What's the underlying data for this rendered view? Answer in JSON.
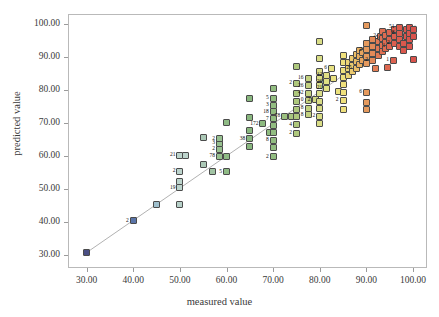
{
  "chart_data": {
    "type": "scatter",
    "title": "",
    "xlabel": "measured value",
    "ylabel": "predicted value",
    "xlim": [
      26,
      103
    ],
    "ylim": [
      26,
      103
    ],
    "grid": false,
    "legend": null,
    "xticks": [
      "30.00",
      "40.00",
      "50.00",
      "60.00",
      "70.00",
      "80.00",
      "90.00",
      "100.00"
    ],
    "xtick_values": [
      30,
      40,
      50,
      60,
      70,
      80,
      90,
      100
    ],
    "yticks": [
      "30.00",
      "40.00",
      "50.00",
      "60.00",
      "70.00",
      "80.00",
      "90.00",
      "100.00"
    ],
    "ytick_values": [
      30,
      40,
      50,
      60,
      70,
      80,
      90,
      100
    ],
    "reference_line": {
      "from": [
        29.5,
        30.2
      ],
      "to": [
        100.5,
        99.5
      ],
      "color": "#a8a8a8"
    },
    "marker": {
      "shape": "square",
      "size_px": 7,
      "edge_color": "#4b4b4b"
    },
    "color_scale": {
      "type": "gradient-by-x",
      "stops": [
        {
          "x": 30,
          "color": "#4a4f84"
        },
        {
          "x": 40,
          "color": "#5a74a8"
        },
        {
          "x": 45,
          "color": "#9fc0cd"
        },
        {
          "x": 50,
          "color": "#b9d3cb"
        },
        {
          "x": 55,
          "color": "#a8c6b4"
        },
        {
          "x": 60,
          "color": "#8fba84"
        },
        {
          "x": 65,
          "color": "#89b77f"
        },
        {
          "x": 70,
          "color": "#93bd80"
        },
        {
          "x": 75,
          "color": "#b3c97c"
        },
        {
          "x": 80,
          "color": "#d8dd86"
        },
        {
          "x": 85,
          "color": "#efe07c"
        },
        {
          "x": 88,
          "color": "#ecc268"
        },
        {
          "x": 90,
          "color": "#e59a5e"
        },
        {
          "x": 93,
          "color": "#e27a54"
        },
        {
          "x": 96,
          "color": "#dd6450"
        },
        {
          "x": 100,
          "color": "#d9534c"
        }
      ]
    },
    "points": [
      {
        "x": 30.0,
        "y": 30.6,
        "c": "#4a4f84",
        "n": ""
      },
      {
        "x": 40.0,
        "y": 40.3,
        "c": "#5a74a8",
        "n": "2"
      },
      {
        "x": 45.0,
        "y": 45.2,
        "c": "#9fc0cd",
        "n": ""
      },
      {
        "x": 50.0,
        "y": 45.2,
        "c": "#b6d0c8",
        "n": ""
      },
      {
        "x": 50.0,
        "y": 50.3,
        "c": "#bcd4cc",
        "n": "19"
      },
      {
        "x": 50.0,
        "y": 52.3,
        "c": "#bcd4cc",
        "n": ""
      },
      {
        "x": 50.0,
        "y": 55.3,
        "c": "#bcd4cc",
        "n": "2"
      },
      {
        "x": 50.0,
        "y": 60.2,
        "c": "#bcd4cc",
        "n": "21"
      },
      {
        "x": 51.3,
        "y": 60.2,
        "c": "#bcd4cc",
        "n": ""
      },
      {
        "x": 55.0,
        "y": 57.4,
        "c": "#abc8b6",
        "n": ""
      },
      {
        "x": 55.0,
        "y": 65.5,
        "c": "#abc8b6",
        "n": ""
      },
      {
        "x": 57.0,
        "y": 55.2,
        "c": "#a2c4a4",
        "n": ""
      },
      {
        "x": 58.5,
        "y": 59.9,
        "c": "#97c08f",
        "n": "78"
      },
      {
        "x": 58.5,
        "y": 62.0,
        "c": "#97c08f",
        "n": "2"
      },
      {
        "x": 58.5,
        "y": 63.8,
        "c": "#97c08f",
        "n": "3"
      },
      {
        "x": 58.5,
        "y": 65.2,
        "c": "#97c08f",
        "n": "2"
      },
      {
        "x": 60.0,
        "y": 55.2,
        "c": "#8fbb85",
        "n": "5"
      },
      {
        "x": 60.0,
        "y": 59.8,
        "c": "#8fbb85",
        "n": ""
      },
      {
        "x": 60.0,
        "y": 70.0,
        "c": "#8fbb85",
        "n": ""
      },
      {
        "x": 65.0,
        "y": 62.8,
        "c": "#89b77f",
        "n": ""
      },
      {
        "x": 65.0,
        "y": 65.2,
        "c": "#89b77f",
        "n": "38"
      },
      {
        "x": 65.0,
        "y": 67.8,
        "c": "#89b77f",
        "n": ""
      },
      {
        "x": 65.0,
        "y": 71.5,
        "c": "#89b77f",
        "n": ""
      },
      {
        "x": 65.0,
        "y": 77.4,
        "c": "#89b77f",
        "n": ""
      },
      {
        "x": 67.8,
        "y": 69.8,
        "c": "#8dba80",
        "n": "172"
      },
      {
        "x": 69.3,
        "y": 67.0,
        "c": "#90bc80",
        "n": ""
      },
      {
        "x": 70.0,
        "y": 59.8,
        "c": "#92bd81",
        "n": "2"
      },
      {
        "x": 70.0,
        "y": 62.5,
        "c": "#92bd81",
        "n": ""
      },
      {
        "x": 70.0,
        "y": 64.7,
        "c": "#92bd81",
        "n": "8"
      },
      {
        "x": 70.0,
        "y": 67.2,
        "c": "#92bd81",
        "n": ""
      },
      {
        "x": 70.0,
        "y": 69.3,
        "c": "#92bd81",
        "n": ""
      },
      {
        "x": 70.0,
        "y": 71.3,
        "c": "#92bd81",
        "n": "7"
      },
      {
        "x": 70.0,
        "y": 73.4,
        "c": "#92bd81",
        "n": "18"
      },
      {
        "x": 70.0,
        "y": 75.4,
        "c": "#92bd81",
        "n": "3"
      },
      {
        "x": 70.0,
        "y": 77.5,
        "c": "#92bd81",
        "n": "5"
      },
      {
        "x": 70.0,
        "y": 80.5,
        "c": "#92bd81",
        "n": ""
      },
      {
        "x": 72.5,
        "y": 72.0,
        "c": "#9cc180",
        "n": "78"
      },
      {
        "x": 74.0,
        "y": 71.8,
        "c": "#a7c57e",
        "n": ""
      },
      {
        "x": 75.0,
        "y": 66.8,
        "c": "#aec87d",
        "n": "2"
      },
      {
        "x": 75.0,
        "y": 69.5,
        "c": "#aec87d",
        "n": "4"
      },
      {
        "x": 75.0,
        "y": 72.0,
        "c": "#aec87d",
        "n": ""
      },
      {
        "x": 75.0,
        "y": 74.2,
        "c": "#aec87d",
        "n": ""
      },
      {
        "x": 75.0,
        "y": 76.5,
        "c": "#aec87d",
        "n": ""
      },
      {
        "x": 75.0,
        "y": 79.0,
        "c": "#aec87d",
        "n": ""
      },
      {
        "x": 75.0,
        "y": 82.0,
        "c": "#aec87d",
        "n": "2"
      },
      {
        "x": 75.0,
        "y": 87.2,
        "c": "#aec87d",
        "n": ""
      },
      {
        "x": 77.5,
        "y": 72.5,
        "c": "#c3d180",
        "n": "8"
      },
      {
        "x": 77.5,
        "y": 74.5,
        "c": "#c3d180",
        "n": "8"
      },
      {
        "x": 77.5,
        "y": 76.8,
        "c": "#c3d180",
        "n": "0"
      },
      {
        "x": 77.5,
        "y": 79.0,
        "c": "#c3d180",
        "n": "42"
      },
      {
        "x": 77.5,
        "y": 81.2,
        "c": "#c3d180",
        "n": "26"
      },
      {
        "x": 77.5,
        "y": 83.5,
        "c": "#c3d180",
        "n": "16"
      },
      {
        "x": 79.0,
        "y": 77.0,
        "c": "#d2d983",
        "n": "2"
      },
      {
        "x": 80.0,
        "y": 69.7,
        "c": "#d9dd86",
        "n": ""
      },
      {
        "x": 80.0,
        "y": 72.0,
        "c": "#d9dd86",
        "n": "2"
      },
      {
        "x": 80.0,
        "y": 74.4,
        "c": "#d9dd86",
        "n": ""
      },
      {
        "x": 80.0,
        "y": 76.6,
        "c": "#d9dd86",
        "n": ""
      },
      {
        "x": 80.0,
        "y": 78.8,
        "c": "#d9dd86",
        "n": ""
      },
      {
        "x": 80.0,
        "y": 81.2,
        "c": "#d9dd86",
        "n": ""
      },
      {
        "x": 80.0,
        "y": 83.3,
        "c": "#d9dd86",
        "n": ""
      },
      {
        "x": 80.0,
        "y": 85.5,
        "c": "#d9dd86",
        "n": ""
      },
      {
        "x": 80.0,
        "y": 89.5,
        "c": "#d9dd86",
        "n": ""
      },
      {
        "x": 80.0,
        "y": 94.6,
        "c": "#d9dd86",
        "n": ""
      },
      {
        "x": 81.5,
        "y": 80.5,
        "c": "#e0df84",
        "n": "21"
      },
      {
        "x": 81.5,
        "y": 82.5,
        "c": "#e0df84",
        "n": "26"
      },
      {
        "x": 81.5,
        "y": 84.5,
        "c": "#e0df84",
        "n": "12"
      },
      {
        "x": 82.5,
        "y": 86.5,
        "c": "#e7e181",
        "n": "6"
      },
      {
        "x": 83.0,
        "y": 83.5,
        "c": "#e9e180",
        "n": ""
      },
      {
        "x": 84.0,
        "y": 79.5,
        "c": "#ece27e",
        "n": ""
      },
      {
        "x": 85.0,
        "y": 74.2,
        "c": "#efe07c",
        "n": ""
      },
      {
        "x": 85.0,
        "y": 76.8,
        "c": "#efe07c",
        "n": "2"
      },
      {
        "x": 85.0,
        "y": 79.2,
        "c": "#efe07c",
        "n": ""
      },
      {
        "x": 85.0,
        "y": 81.5,
        "c": "#efe07c",
        "n": ""
      },
      {
        "x": 85.0,
        "y": 83.8,
        "c": "#efe07c",
        "n": ""
      },
      {
        "x": 85.0,
        "y": 86.0,
        "c": "#efe07c",
        "n": ""
      },
      {
        "x": 85.0,
        "y": 88.2,
        "c": "#efe07c",
        "n": ""
      },
      {
        "x": 85.0,
        "y": 90.5,
        "c": "#efe07c",
        "n": ""
      },
      {
        "x": 86.2,
        "y": 84.5,
        "c": "#edd576",
        "n": ""
      },
      {
        "x": 86.2,
        "y": 86.5,
        "c": "#edd576",
        "n": ""
      },
      {
        "x": 86.2,
        "y": 88.3,
        "c": "#edd576",
        "n": ""
      },
      {
        "x": 87.0,
        "y": 85.5,
        "c": "#ecca6e",
        "n": ""
      },
      {
        "x": 87.0,
        "y": 87.5,
        "c": "#ecca6e",
        "n": ""
      },
      {
        "x": 87.0,
        "y": 89.5,
        "c": "#ecca6e",
        "n": ""
      },
      {
        "x": 87.8,
        "y": 86.5,
        "c": "#eabe66",
        "n": "25"
      },
      {
        "x": 87.8,
        "y": 88.6,
        "c": "#eabe66",
        "n": ""
      },
      {
        "x": 87.8,
        "y": 90.8,
        "c": "#eabe66",
        "n": ""
      },
      {
        "x": 88.5,
        "y": 87.8,
        "c": "#e8b061",
        "n": ""
      },
      {
        "x": 88.5,
        "y": 90.0,
        "c": "#e8b061",
        "n": ""
      },
      {
        "x": 88.5,
        "y": 92.0,
        "c": "#e8b061",
        "n": ""
      },
      {
        "x": 89.2,
        "y": 89.0,
        "c": "#e7a35e",
        "n": ""
      },
      {
        "x": 89.2,
        "y": 91.2,
        "c": "#e7a35e",
        "n": ""
      },
      {
        "x": 90.0,
        "y": 74.0,
        "c": "#e59a5e",
        "n": ""
      },
      {
        "x": 90.0,
        "y": 76.3,
        "c": "#e59a5e",
        "n": ""
      },
      {
        "x": 90.0,
        "y": 79.3,
        "c": "#e59a5e",
        "n": "6"
      },
      {
        "x": 90.0,
        "y": 88.0,
        "c": "#e59a5e",
        "n": ""
      },
      {
        "x": 90.0,
        "y": 90.2,
        "c": "#e59a5e",
        "n": ""
      },
      {
        "x": 90.0,
        "y": 92.2,
        "c": "#e59a5e",
        "n": "2"
      },
      {
        "x": 90.0,
        "y": 94.2,
        "c": "#e59a5e",
        "n": ""
      },
      {
        "x": 90.0,
        "y": 99.6,
        "c": "#e59a5e",
        "n": ""
      },
      {
        "x": 91.3,
        "y": 89.0,
        "c": "#e48a58",
        "n": "2"
      },
      {
        "x": 91.3,
        "y": 91.0,
        "c": "#e48a58",
        "n": ""
      },
      {
        "x": 91.3,
        "y": 93.2,
        "c": "#e48a58",
        "n": ""
      },
      {
        "x": 91.3,
        "y": 95.3,
        "c": "#e48a58",
        "n": ""
      },
      {
        "x": 92.0,
        "y": 86.6,
        "c": "#e37e55",
        "n": ""
      },
      {
        "x": 92.5,
        "y": 90.5,
        "c": "#e27954",
        "n": ""
      },
      {
        "x": 92.5,
        "y": 92.5,
        "c": "#e27954",
        "n": ""
      },
      {
        "x": 92.5,
        "y": 94.6,
        "c": "#e27954",
        "n": ""
      },
      {
        "x": 93.0,
        "y": 96.3,
        "c": "#e17253",
        "n": "2"
      },
      {
        "x": 93.5,
        "y": 91.5,
        "c": "#e07053",
        "n": ""
      },
      {
        "x": 93.5,
        "y": 93.6,
        "c": "#e07053",
        "n": ""
      },
      {
        "x": 93.5,
        "y": 95.6,
        "c": "#e07053",
        "n": "5"
      },
      {
        "x": 93.5,
        "y": 97.6,
        "c": "#e07053",
        "n": ""
      },
      {
        "x": 94.2,
        "y": 92.5,
        "c": "#de6b51",
        "n": ""
      },
      {
        "x": 94.2,
        "y": 94.5,
        "c": "#de6b51",
        "n": ""
      },
      {
        "x": 94.2,
        "y": 96.5,
        "c": "#de6b51",
        "n": ""
      },
      {
        "x": 94.5,
        "y": 86.8,
        "c": "#de6850",
        "n": ""
      },
      {
        "x": 95.0,
        "y": 93.2,
        "c": "#dd6550",
        "n": "1"
      },
      {
        "x": 95.0,
        "y": 95.3,
        "c": "#dd6550",
        "n": ""
      },
      {
        "x": 95.0,
        "y": 97.4,
        "c": "#dd6550",
        "n": ""
      },
      {
        "x": 95.8,
        "y": 89.0,
        "c": "#dc6250",
        "n": "1"
      },
      {
        "x": 96.0,
        "y": 94.2,
        "c": "#dc5f4f",
        "n": "2"
      },
      {
        "x": 96.0,
        "y": 96.2,
        "c": "#dc5f4f",
        "n": ""
      },
      {
        "x": 96.0,
        "y": 98.2,
        "c": "#dc5f4f",
        "n": ""
      },
      {
        "x": 97.0,
        "y": 93.0,
        "c": "#db5c4e",
        "n": ""
      },
      {
        "x": 97.0,
        "y": 95.2,
        "c": "#db5c4e",
        "n": ""
      },
      {
        "x": 97.0,
        "y": 97.2,
        "c": "#db5c4e",
        "n": "8"
      },
      {
        "x": 97.0,
        "y": 99.0,
        "c": "#db5c4e",
        "n": "51"
      },
      {
        "x": 98.0,
        "y": 92.0,
        "c": "#da584d",
        "n": ""
      },
      {
        "x": 98.0,
        "y": 94.2,
        "c": "#da584d",
        "n": ""
      },
      {
        "x": 98.5,
        "y": 96.2,
        "c": "#da564c",
        "n": ""
      },
      {
        "x": 98.5,
        "y": 98.2,
        "c": "#da564c",
        "n": ""
      },
      {
        "x": 99.2,
        "y": 93.2,
        "c": "#d9544c",
        "n": ""
      },
      {
        "x": 99.2,
        "y": 95.2,
        "c": "#d9544c",
        "n": ""
      },
      {
        "x": 99.2,
        "y": 97.2,
        "c": "#d9544c",
        "n": ""
      },
      {
        "x": 99.2,
        "y": 99.0,
        "c": "#d9544c",
        "n": ""
      },
      {
        "x": 100.2,
        "y": 89.3,
        "c": "#d9534c",
        "n": ""
      },
      {
        "x": 100.2,
        "y": 96.3,
        "c": "#d9534c",
        "n": ""
      },
      {
        "x": 100.2,
        "y": 98.3,
        "c": "#d9534c",
        "n": ""
      }
    ]
  }
}
